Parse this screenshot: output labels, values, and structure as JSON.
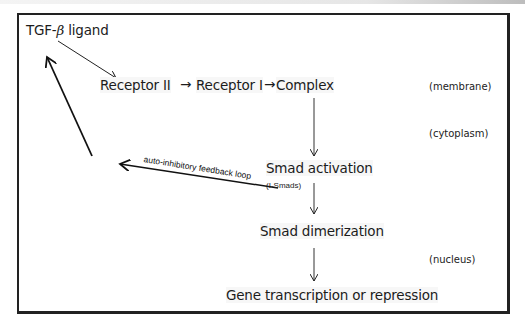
{
  "diagram": {
    "nodes": {
      "ligand": {
        "prefix": "TGF-",
        "greek": "β",
        "suffix": " ligand"
      },
      "receptor2": "Receptor II",
      "receptor1": "Receptor I",
      "complex": "Complex",
      "smad_activation": "Smad activation",
      "smad_dimerization": "Smad dimerization",
      "gene": "Gene transcription or repression"
    },
    "inline_arrows": {
      "r2_to_r1": "→",
      "r1_to_complex": "→"
    },
    "locations": {
      "membrane": "(membrane)",
      "cytoplasm": "(cytoplasm)",
      "nucleus": "(nucleus)"
    },
    "annotations": {
      "i_smads": "(I-Smads)",
      "feedback": "auto-inhibitory feedback loop"
    },
    "edges": [
      {
        "from": "TGF-β ligand",
        "to": "Receptor II"
      },
      {
        "from": "Receptor II",
        "to": "Receptor I"
      },
      {
        "from": "Receptor I",
        "to": "Complex"
      },
      {
        "from": "Complex",
        "to": "Smad activation"
      },
      {
        "from": "Smad activation",
        "to": "Smad dimerization"
      },
      {
        "from": "Smad dimerization",
        "to": "Gene transcription or repression"
      },
      {
        "from": "Smad activation (I-Smads)",
        "to": "TGF-β ligand",
        "label": "auto-inhibitory feedback loop"
      }
    ],
    "colors": {
      "line": "#222222",
      "text": "#1c1c1c",
      "label_bg": "#f7f7f7"
    }
  }
}
